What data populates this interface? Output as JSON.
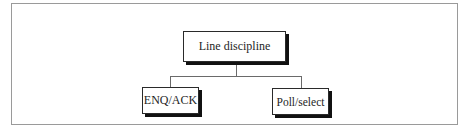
{
  "diagram": {
    "type": "tree",
    "root": {
      "label": "Line discipline"
    },
    "children": [
      {
        "label": "ENQ/ACK"
      },
      {
        "label": "Poll/select"
      }
    ],
    "colors": {
      "background": "#ffffff",
      "frame_border": "#9a9a9a",
      "node_border": "#2a2a2a",
      "node_shadow": "#111111",
      "connector": "#6a6a6a",
      "text": "#1e1e1e"
    }
  }
}
